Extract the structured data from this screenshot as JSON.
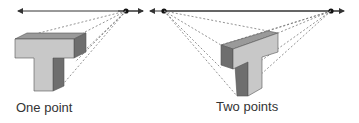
{
  "diagrams": [
    {
      "label": "One point",
      "vanishing_points": 1
    },
    {
      "label": "Two points",
      "vanishing_points": 2
    }
  ],
  "colors": {
    "face_light": "#c8c8c8",
    "face_mid": "#9a9a9a",
    "face_dark": "#6e6e6e",
    "line": "#333333"
  }
}
